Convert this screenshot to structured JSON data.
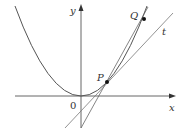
{
  "diagram": {
    "type": "tangent-secant-parabola",
    "labels": {
      "y_axis": "y",
      "x_axis": "x",
      "origin": "0",
      "point_p": "P",
      "point_q": "Q",
      "tangent": "t"
    },
    "colors": {
      "stroke": "#555555",
      "axis": "#666666",
      "point": "#111111",
      "text": "#333333"
    },
    "elements": [
      {
        "kind": "axis",
        "name": "x-axis",
        "arrow": "right"
      },
      {
        "kind": "axis",
        "name": "y-axis",
        "arrow": "up"
      },
      {
        "kind": "curve",
        "name": "parabola",
        "shape": "y = x^2 (vertex at origin)"
      },
      {
        "kind": "point",
        "name": "P",
        "on": "parabola"
      },
      {
        "kind": "point",
        "name": "Q",
        "on": "parabola"
      },
      {
        "kind": "line",
        "name": "t",
        "relation": "tangent to parabola at P"
      },
      {
        "kind": "line",
        "name": "PQ",
        "relation": "secant through P and Q"
      }
    ]
  }
}
